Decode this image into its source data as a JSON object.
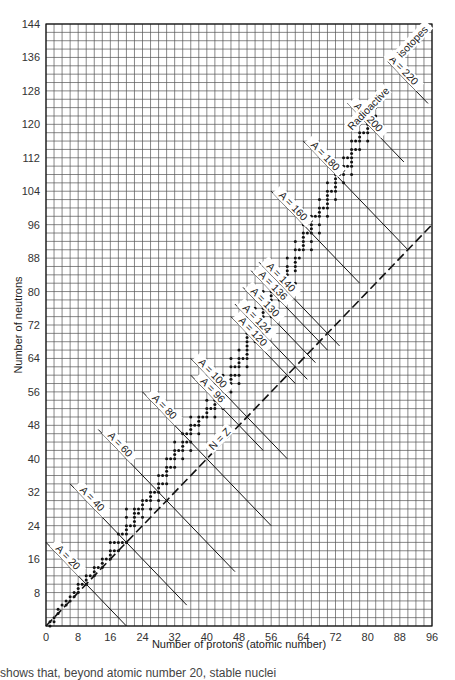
{
  "chart_data": {
    "type": "scatter",
    "title": "",
    "xlabel": "Number of protons (atomic number)",
    "ylabel": "Number of neutrons",
    "xlim": [
      0,
      96
    ],
    "ylim": [
      0,
      144
    ],
    "x_ticks": [
      0,
      8,
      16,
      24,
      32,
      40,
      48,
      56,
      64,
      72,
      80,
      88,
      96
    ],
    "y_ticks": [
      8,
      16,
      24,
      32,
      40,
      48,
      56,
      64,
      72,
      80,
      88,
      96,
      104,
      112,
      120,
      128,
      136,
      144
    ],
    "grid": true,
    "grid_step": 2,
    "reference_line": {
      "label": "N = Z",
      "style": "dashed",
      "from": [
        0,
        0
      ],
      "to": [
        96,
        96
      ]
    },
    "annotation": "Radioactive isotopes",
    "isobars": [
      {
        "label": "A = 20",
        "A": 20,
        "from": [
          0,
          20
        ],
        "to": [
          20,
          0
        ]
      },
      {
        "label": "A = 40",
        "A": 40,
        "from": [
          6,
          34
        ],
        "to": [
          35,
          5
        ]
      },
      {
        "label": "A = 60",
        "A": 60,
        "from": [
          13,
          47
        ],
        "to": [
          47,
          13
        ]
      },
      {
        "label": "A = 80",
        "A": 80,
        "from": [
          24,
          56
        ],
        "to": [
          56,
          24
        ]
      },
      {
        "label": "A = 96",
        "A": 96,
        "from": [
          36,
          60
        ],
        "to": [
          54,
          42
        ]
      },
      {
        "label": "A = 100",
        "A": 100,
        "from": [
          36,
          64
        ],
        "to": [
          60,
          40
        ]
      },
      {
        "label": "A = 120",
        "A": 120,
        "from": [
          46,
          74
        ],
        "to": [
          62,
          58
        ]
      },
      {
        "label": "A = 124",
        "A": 124,
        "from": [
          47,
          77
        ],
        "to": [
          65,
          59
        ]
      },
      {
        "label": "A = 130",
        "A": 130,
        "from": [
          49,
          81
        ],
        "to": [
          67,
          63
        ]
      },
      {
        "label": "A = 136",
        "A": 136,
        "from": [
          51,
          85
        ],
        "to": [
          70,
          66
        ]
      },
      {
        "label": "A = 140",
        "A": 140,
        "from": [
          53,
          87
        ],
        "to": [
          73,
          67
        ]
      },
      {
        "label": "A = 160",
        "A": 160,
        "from": [
          56,
          104
        ],
        "to": [
          78,
          82
        ]
      },
      {
        "label": "A = 180",
        "A": 180,
        "from": [
          64,
          116
        ],
        "to": [
          90,
          90
        ]
      },
      {
        "label": "A = 200",
        "A": 200,
        "from": [
          75,
          125
        ],
        "to": [
          89,
          111
        ]
      },
      {
        "label": "A = 220",
        "A": 220,
        "from": [
          85,
          135
        ],
        "to": [
          95,
          125
        ]
      }
    ],
    "series": [
      {
        "name": "Stable isotopes",
        "points": [
          [
            1,
            0
          ],
          [
            1,
            1
          ],
          [
            2,
            1
          ],
          [
            2,
            2
          ],
          [
            3,
            3
          ],
          [
            3,
            4
          ],
          [
            4,
            5
          ],
          [
            5,
            5
          ],
          [
            5,
            6
          ],
          [
            6,
            6
          ],
          [
            6,
            7
          ],
          [
            7,
            7
          ],
          [
            7,
            8
          ],
          [
            8,
            8
          ],
          [
            8,
            9
          ],
          [
            8,
            10
          ],
          [
            9,
            10
          ],
          [
            10,
            10
          ],
          [
            10,
            11
          ],
          [
            10,
            12
          ],
          [
            11,
            12
          ],
          [
            12,
            12
          ],
          [
            12,
            13
          ],
          [
            12,
            14
          ],
          [
            13,
            14
          ],
          [
            14,
            14
          ],
          [
            14,
            15
          ],
          [
            14,
            16
          ],
          [
            15,
            16
          ],
          [
            16,
            16
          ],
          [
            16,
            17
          ],
          [
            16,
            18
          ],
          [
            16,
            20
          ],
          [
            17,
            18
          ],
          [
            17,
            20
          ],
          [
            18,
            18
          ],
          [
            18,
            20
          ],
          [
            18,
            22
          ],
          [
            19,
            20
          ],
          [
            19,
            22
          ],
          [
            20,
            20
          ],
          [
            20,
            22
          ],
          [
            20,
            23
          ],
          [
            20,
            24
          ],
          [
            20,
            26
          ],
          [
            20,
            28
          ],
          [
            21,
            24
          ],
          [
            22,
            24
          ],
          [
            22,
            25
          ],
          [
            22,
            26
          ],
          [
            22,
            27
          ],
          [
            22,
            28
          ],
          [
            23,
            27
          ],
          [
            23,
            28
          ],
          [
            24,
            26
          ],
          [
            24,
            28
          ],
          [
            24,
            29
          ],
          [
            24,
            30
          ],
          [
            25,
            30
          ],
          [
            26,
            28
          ],
          [
            26,
            30
          ],
          [
            26,
            31
          ],
          [
            26,
            32
          ],
          [
            27,
            32
          ],
          [
            28,
            30
          ],
          [
            28,
            32
          ],
          [
            28,
            33
          ],
          [
            28,
            34
          ],
          [
            28,
            36
          ],
          [
            29,
            34
          ],
          [
            29,
            36
          ],
          [
            30,
            34
          ],
          [
            30,
            36
          ],
          [
            30,
            37
          ],
          [
            30,
            38
          ],
          [
            30,
            40
          ],
          [
            31,
            38
          ],
          [
            31,
            40
          ],
          [
            32,
            38
          ],
          [
            32,
            40
          ],
          [
            32,
            41
          ],
          [
            32,
            42
          ],
          [
            32,
            44
          ],
          [
            33,
            42
          ],
          [
            34,
            40
          ],
          [
            34,
            42
          ],
          [
            34,
            43
          ],
          [
            34,
            44
          ],
          [
            34,
            46
          ],
          [
            35,
            44
          ],
          [
            35,
            46
          ],
          [
            36,
            42
          ],
          [
            36,
            44
          ],
          [
            36,
            46
          ],
          [
            36,
            47
          ],
          [
            36,
            48
          ],
          [
            36,
            50
          ],
          [
            37,
            48
          ],
          [
            38,
            46
          ],
          [
            38,
            48
          ],
          [
            38,
            49
          ],
          [
            38,
            50
          ],
          [
            39,
            50
          ],
          [
            40,
            50
          ],
          [
            40,
            51
          ],
          [
            40,
            52
          ],
          [
            40,
            54
          ],
          [
            41,
            52
          ],
          [
            42,
            50
          ],
          [
            42,
            52
          ],
          [
            42,
            53
          ],
          [
            42,
            54
          ],
          [
            42,
            55
          ],
          [
            42,
            56
          ],
          [
            42,
            58
          ],
          [
            44,
            52
          ],
          [
            44,
            54
          ],
          [
            44,
            55
          ],
          [
            44,
            56
          ],
          [
            44,
            57
          ],
          [
            44,
            58
          ],
          [
            44,
            60
          ],
          [
            45,
            58
          ],
          [
            46,
            56
          ],
          [
            46,
            58
          ],
          [
            46,
            59
          ],
          [
            46,
            60
          ],
          [
            46,
            62
          ],
          [
            46,
            64
          ],
          [
            47,
            60
          ],
          [
            47,
            62
          ],
          [
            48,
            58
          ],
          [
            48,
            60
          ],
          [
            48,
            62
          ],
          [
            48,
            63
          ],
          [
            48,
            64
          ],
          [
            48,
            66
          ],
          [
            49,
            64
          ],
          [
            50,
            62
          ],
          [
            50,
            64
          ],
          [
            50,
            65
          ],
          [
            50,
            66
          ],
          [
            50,
            67
          ],
          [
            50,
            68
          ],
          [
            50,
            69
          ],
          [
            50,
            70
          ],
          [
            50,
            72
          ],
          [
            50,
            74
          ],
          [
            51,
            70
          ],
          [
            51,
            72
          ],
          [
            52,
            68
          ],
          [
            52,
            70
          ],
          [
            52,
            72
          ],
          [
            52,
            73
          ],
          [
            52,
            74
          ],
          [
            52,
            76
          ],
          [
            53,
            74
          ],
          [
            54,
            70
          ],
          [
            54,
            72
          ],
          [
            54,
            74
          ],
          [
            54,
            75
          ],
          [
            54,
            76
          ],
          [
            54,
            77
          ],
          [
            54,
            78
          ],
          [
            54,
            80
          ],
          [
            55,
            78
          ],
          [
            56,
            74
          ],
          [
            56,
            76
          ],
          [
            56,
            78
          ],
          [
            56,
            79
          ],
          [
            56,
            80
          ],
          [
            56,
            81
          ],
          [
            56,
            82
          ],
          [
            57,
            82
          ],
          [
            58,
            78
          ],
          [
            58,
            80
          ],
          [
            58,
            82
          ],
          [
            58,
            84
          ],
          [
            59,
            82
          ],
          [
            60,
            82
          ],
          [
            60,
            83
          ],
          [
            60,
            84
          ],
          [
            60,
            85
          ],
          [
            60,
            86
          ],
          [
            60,
            88
          ],
          [
            62,
            82
          ],
          [
            62,
            85
          ],
          [
            62,
            86
          ],
          [
            62,
            87
          ],
          [
            62,
            88
          ],
          [
            62,
            90
          ],
          [
            62,
            92
          ],
          [
            63,
            88
          ],
          [
            63,
            90
          ],
          [
            64,
            90
          ],
          [
            64,
            91
          ],
          [
            64,
            92
          ],
          [
            64,
            93
          ],
          [
            64,
            94
          ],
          [
            64,
            96
          ],
          [
            65,
            94
          ],
          [
            66,
            90
          ],
          [
            66,
            92
          ],
          [
            66,
            94
          ],
          [
            66,
            95
          ],
          [
            66,
            96
          ],
          [
            66,
            97
          ],
          [
            66,
            98
          ],
          [
            67,
            98
          ],
          [
            68,
            94
          ],
          [
            68,
            96
          ],
          [
            68,
            98
          ],
          [
            68,
            99
          ],
          [
            68,
            100
          ],
          [
            68,
            102
          ],
          [
            69,
            100
          ],
          [
            70,
            98
          ],
          [
            70,
            100
          ],
          [
            70,
            101
          ],
          [
            70,
            102
          ],
          [
            70,
            103
          ],
          [
            70,
            104
          ],
          [
            70,
            106
          ],
          [
            71,
            104
          ],
          [
            72,
            102
          ],
          [
            72,
            104
          ],
          [
            72,
            105
          ],
          [
            72,
            106
          ],
          [
            72,
            107
          ],
          [
            72,
            108
          ],
          [
            73,
            108
          ],
          [
            74,
            106
          ],
          [
            74,
            108
          ],
          [
            74,
            109
          ],
          [
            74,
            110
          ],
          [
            74,
            112
          ],
          [
            75,
            110
          ],
          [
            75,
            112
          ],
          [
            76,
            108
          ],
          [
            76,
            110
          ],
          [
            76,
            111
          ],
          [
            76,
            112
          ],
          [
            76,
            113
          ],
          [
            76,
            114
          ],
          [
            76,
            116
          ],
          [
            77,
            114
          ],
          [
            77,
            116
          ],
          [
            78,
            114
          ],
          [
            78,
            116
          ],
          [
            78,
            117
          ],
          [
            78,
            118
          ],
          [
            78,
            120
          ],
          [
            79,
            118
          ],
          [
            80,
            116
          ],
          [
            80,
            118
          ],
          [
            80,
            119
          ],
          [
            80,
            120
          ],
          [
            80,
            121
          ],
          [
            80,
            122
          ],
          [
            80,
            124
          ],
          [
            81,
            122
          ],
          [
            81,
            124
          ],
          [
            82,
            122
          ],
          [
            82,
            124
          ],
          [
            82,
            125
          ],
          [
            82,
            126
          ],
          [
            83,
            126
          ]
        ]
      }
    ]
  },
  "footer": {
    "cut_off_text": "shows that, beyond atomic number 20, stable nuclei"
  }
}
